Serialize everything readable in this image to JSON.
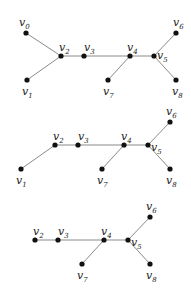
{
  "colors": {
    "edge": "#8a8a8a",
    "node": "#111111",
    "label": "#222222",
    "background": "#ffffff"
  },
  "graphs": [
    {
      "name": "tree-1",
      "nodes": [
        {
          "id": "v0",
          "base": "v",
          "sub": "0",
          "x": 26,
          "y": 33,
          "lx": 19,
          "ly": 26
        },
        {
          "id": "v1",
          "base": "v",
          "sub": "1",
          "x": 27,
          "y": 80,
          "lx": 22,
          "ly": 95
        },
        {
          "id": "v2",
          "base": "v",
          "sub": "2",
          "x": 61,
          "y": 56,
          "lx": 59,
          "ly": 51
        },
        {
          "id": "v3",
          "base": "v",
          "sub": "3",
          "x": 84,
          "y": 56,
          "lx": 84,
          "ly": 51
        },
        {
          "id": "v4",
          "base": "v",
          "sub": "4",
          "x": 130,
          "y": 56,
          "lx": 127,
          "ly": 51
        },
        {
          "id": "v5",
          "base": "v",
          "sub": "5",
          "x": 154,
          "y": 56,
          "lx": 157,
          "ly": 59
        },
        {
          "id": "v6",
          "base": "v",
          "sub": "6",
          "x": 176,
          "y": 33,
          "lx": 173,
          "ly": 26
        },
        {
          "id": "v7",
          "base": "v",
          "sub": "7",
          "x": 108,
          "y": 80,
          "lx": 103,
          "ly": 95
        },
        {
          "id": "v8",
          "base": "v",
          "sub": "8",
          "x": 176,
          "y": 80,
          "lx": 172,
          "ly": 95
        }
      ],
      "edges": [
        [
          "v0",
          "v2"
        ],
        [
          "v1",
          "v2"
        ],
        [
          "v2",
          "v3"
        ],
        [
          "v3",
          "v4"
        ],
        [
          "v4",
          "v5"
        ],
        [
          "v4",
          "v7"
        ],
        [
          "v5",
          "v6"
        ],
        [
          "v5",
          "v8"
        ]
      ]
    },
    {
      "name": "tree-2",
      "nodes": [
        {
          "id": "v1",
          "base": "v",
          "sub": "1",
          "x": 21,
          "y": 169,
          "lx": 16,
          "ly": 184
        },
        {
          "id": "v2",
          "base": "v",
          "sub": "2",
          "x": 55,
          "y": 145,
          "lx": 53,
          "ly": 140
        },
        {
          "id": "v3",
          "base": "v",
          "sub": "3",
          "x": 78,
          "y": 145,
          "lx": 78,
          "ly": 140
        },
        {
          "id": "v4",
          "base": "v",
          "sub": "4",
          "x": 124,
          "y": 145,
          "lx": 121,
          "ly": 140
        },
        {
          "id": "v5",
          "base": "v",
          "sub": "5",
          "x": 148,
          "y": 145,
          "lx": 151,
          "ly": 151
        },
        {
          "id": "v6",
          "base": "v",
          "sub": "6",
          "x": 170,
          "y": 122,
          "lx": 166,
          "ly": 115
        },
        {
          "id": "v7",
          "base": "v",
          "sub": "7",
          "x": 102,
          "y": 169,
          "lx": 97,
          "ly": 184
        },
        {
          "id": "v8",
          "base": "v",
          "sub": "8",
          "x": 170,
          "y": 169,
          "lx": 166,
          "ly": 184
        }
      ],
      "edges": [
        [
          "v1",
          "v2"
        ],
        [
          "v2",
          "v3"
        ],
        [
          "v3",
          "v4"
        ],
        [
          "v4",
          "v5"
        ],
        [
          "v4",
          "v7"
        ],
        [
          "v5",
          "v6"
        ],
        [
          "v5",
          "v8"
        ]
      ]
    },
    {
      "name": "tree-3",
      "nodes": [
        {
          "id": "v2",
          "base": "v",
          "sub": "2",
          "x": 35,
          "y": 240,
          "lx": 33,
          "ly": 235
        },
        {
          "id": "v3",
          "base": "v",
          "sub": "3",
          "x": 58,
          "y": 240,
          "lx": 58,
          "ly": 235
        },
        {
          "id": "v4",
          "base": "v",
          "sub": "4",
          "x": 104,
          "y": 240,
          "lx": 101,
          "ly": 235
        },
        {
          "id": "v5",
          "base": "v",
          "sub": "5",
          "x": 128,
          "y": 240,
          "lx": 131,
          "ly": 246
        },
        {
          "id": "v6",
          "base": "v",
          "sub": "6",
          "x": 150,
          "y": 217,
          "lx": 146,
          "ly": 210
        },
        {
          "id": "v7",
          "base": "v",
          "sub": "7",
          "x": 82,
          "y": 264,
          "lx": 77,
          "ly": 279
        },
        {
          "id": "v8",
          "base": "v",
          "sub": "8",
          "x": 150,
          "y": 264,
          "lx": 146,
          "ly": 279
        }
      ],
      "edges": [
        [
          "v2",
          "v3"
        ],
        [
          "v3",
          "v4"
        ],
        [
          "v4",
          "v5"
        ],
        [
          "v4",
          "v7"
        ],
        [
          "v5",
          "v6"
        ],
        [
          "v5",
          "v8"
        ]
      ]
    }
  ]
}
